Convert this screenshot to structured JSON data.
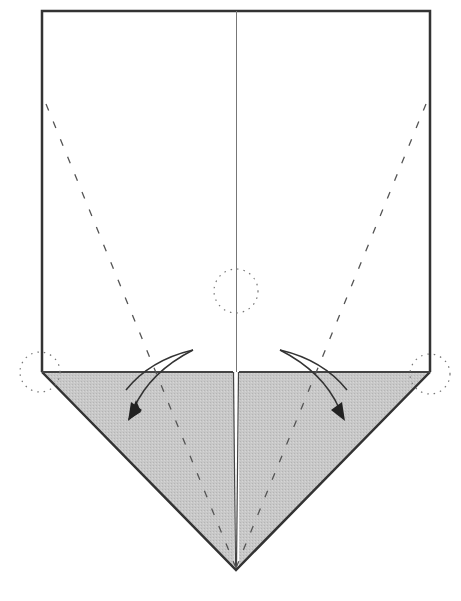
{
  "diagram": {
    "type": "origami-step",
    "colors": {
      "paper_front": "#ffffff",
      "paper_back": "#cccccc",
      "line": "#333333",
      "crease": "#555555",
      "dotted": "#777777"
    },
    "sheet": {
      "left": 42,
      "right": 430,
      "top": 11,
      "fold_y": 372,
      "center_x": 236,
      "point_y": 570
    },
    "valley_folds": [
      {
        "name": "left-valley-fold",
        "from": [
          46,
          104
        ],
        "to": [
          236,
          570
        ]
      },
      {
        "name": "right-valley-fold",
        "from": [
          426,
          104
        ],
        "to": [
          236,
          570
        ]
      }
    ],
    "reference_circles": [
      {
        "name": "center-reference-circle",
        "cx": 236,
        "cy": 291,
        "r": 22
      },
      {
        "name": "left-corner-circle",
        "cx": 40,
        "cy": 372,
        "r": 20
      },
      {
        "name": "right-corner-circle",
        "cx": 430,
        "cy": 374,
        "r": 20
      }
    ],
    "arrows": [
      {
        "name": "left-fold-arrow",
        "direction": "down-left"
      },
      {
        "name": "right-fold-arrow",
        "direction": "down-right"
      }
    ]
  }
}
